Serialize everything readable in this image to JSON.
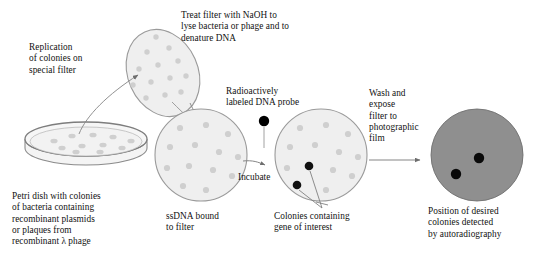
{
  "figure": {
    "title_hidden": "Colony / plaque hybridization screening",
    "palette": {
      "background": "#ffffff",
      "text": "#111111",
      "filter_fill": "#efefef",
      "filter_stroke": "#9a9a9a",
      "dish_fill": "#f2f2f2",
      "dish_stroke": "#8c8c8c",
      "colony_gray": "#cccccc",
      "colony_dark": "#000000",
      "film_fill": "#8f8f8f",
      "film_stroke": "#6f6f6f",
      "arrow": "#6e6e6e"
    }
  },
  "labels": {
    "replication": "Replication\nof colonies on\nspecial filter",
    "treat_filter": "Treat filter with NaOH to\nlyse bacteria or phage and to\ndenature DNA",
    "probe": "Radioactively\nlabeled DNA probe",
    "wash_expose": "Wash and\nexpose\nfilter to\nphotographic\nfilm",
    "petri_dish": "Petri dish with colonies\nof bacteria containing\nrecombinant plasmids\nor plaques from\nrecombinant λ phage",
    "ssdna": "ssDNA bound\nto filter",
    "incubate": "Incubate",
    "colonies_gene": "Colonies containing\ngene of interest",
    "autorad": "Position of desired\ncolonies detected\nby autoradiography"
  },
  "stages": {
    "petri": {
      "name": "petri-dish",
      "colony_count": 11
    },
    "tilted_filter": {
      "name": "replica-filter",
      "colony_count": 13
    },
    "filter_ssdna": {
      "name": "ssdna-filter",
      "colony_count": 13
    },
    "filter_probe": {
      "name": "probed-filter",
      "gray_spot_count": 11,
      "dark_spot_count": 2
    },
    "film": {
      "name": "autoradiograph-film",
      "dark_spot_count": 2
    }
  },
  "probe_dot": {
    "label_ref": "Radioactively labeled DNA probe",
    "color": "#000000"
  },
  "arrows": [
    {
      "name": "arrow-dish-to-filter",
      "kind": "curved"
    },
    {
      "name": "arrow-filter-to-ssdna",
      "kind": "curved"
    },
    {
      "name": "arrow-incubate",
      "kind": "curved"
    },
    {
      "name": "arrow-probe-drop",
      "kind": "straight-down"
    },
    {
      "name": "arrow-wash-expose",
      "kind": "straight-right"
    },
    {
      "name": "leader-colonies-gene",
      "kind": "pointer"
    }
  ]
}
